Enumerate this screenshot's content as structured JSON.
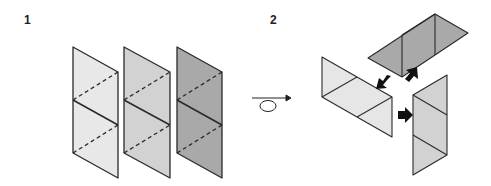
{
  "steps": [
    {
      "number": "1",
      "description": "Three parallelogram sheets, each with a solid center fold and two dashed fold lines"
    },
    {
      "number": "2",
      "description": "Folded pieces assembled together, arrows indicate joining directions"
    }
  ],
  "colors": {
    "sheet_light": "#e8e8e8",
    "sheet_medium": "#d2d2d2",
    "sheet_dark": "#a9a9a9",
    "outline": "#2a2a2a",
    "arrow": "#111111",
    "background": "#ffffff"
  },
  "icons": {
    "rotate": "rotate-loop-arrow-icon"
  }
}
